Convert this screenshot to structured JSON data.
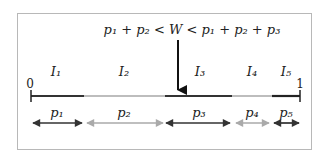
{
  "diagram": {
    "condition": "p₁ + p₂ < W < p₁ + p₂ + p₃",
    "axis": {
      "start_label": "0",
      "end_label": "1"
    },
    "intervals": [
      {
        "label": "I₁",
        "prob": "p₁",
        "x1": 31,
        "x2": 84,
        "color": "#333333",
        "arrow_color": "#333333"
      },
      {
        "label": "I₂",
        "prob": "p₂",
        "x1": 84,
        "x2": 165,
        "color": "#bdbdbd",
        "arrow_color": "#9e9e9e"
      },
      {
        "label": "I₃",
        "prob": "p₃",
        "x1": 165,
        "x2": 232,
        "color": "#333333",
        "arrow_color": "#333333"
      },
      {
        "label": "I₄",
        "prob": "p₄",
        "x1": 232,
        "x2": 272,
        "color": "#bdbdbd",
        "arrow_color": "#9e9e9e"
      },
      {
        "label": "I₅",
        "prob": "p₅",
        "x1": 272,
        "x2": 300,
        "color": "#222222",
        "arrow_color": "#222222"
      }
    ],
    "pointer": {
      "x": 178,
      "label": "W"
    }
  }
}
